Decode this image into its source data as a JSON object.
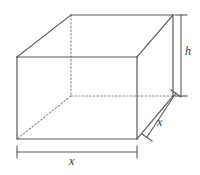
{
  "figure": {
    "name": "rectangular-box-diagram",
    "type": "3d-wireframe-rectangular-prism",
    "background_color": "#ffffff",
    "line_color": "#5a5a5a",
    "hidden_line_color": "#8c8c8c",
    "label_color": "#3a3a3a",
    "labels": {
      "height": "h",
      "depth": "x",
      "width": "x"
    },
    "dimensions": [
      {
        "name": "height",
        "label": "h",
        "position": "right-vertical"
      },
      {
        "name": "depth",
        "label": "x",
        "position": "right-diagonal"
      },
      {
        "name": "width",
        "label": "x",
        "position": "bottom-horizontal"
      }
    ],
    "vertices": {
      "front_top_left": [
        17,
        57
      ],
      "front_top_right": [
        137,
        57
      ],
      "front_bottom_right": [
        137,
        139
      ],
      "front_bottom_left": [
        17,
        139
      ],
      "back_top_left": [
        71,
        15
      ],
      "back_top_right": [
        173,
        15
      ],
      "back_bottom_right": [
        173,
        96
      ],
      "back_bottom_left": [
        71,
        96
      ]
    }
  }
}
